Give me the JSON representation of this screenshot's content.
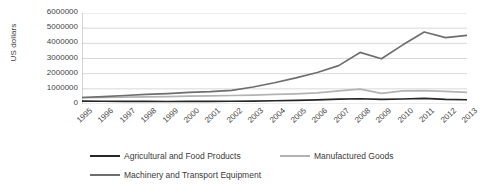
{
  "chart_data": {
    "type": "line",
    "title": "",
    "xlabel": "",
    "ylabel": "US dollars",
    "grid": true,
    "legend_position": "bottom",
    "ylim": [
      0,
      6000000
    ],
    "ytick_labels": [
      "6000000",
      "5000000",
      "4000000",
      "3000000",
      "2000000",
      "1000000",
      "0"
    ],
    "ytick_values": [
      6000000,
      5000000,
      4000000,
      3000000,
      2000000,
      1000000,
      0
    ],
    "categories": [
      "1995",
      "1996",
      "1997",
      "1998",
      "1999",
      "2000",
      "2001",
      "2002",
      "2003",
      "2004",
      "2005",
      "2006",
      "2007",
      "2008",
      "2009",
      "2010",
      "2011",
      "2012",
      "2013"
    ],
    "series": [
      {
        "name": "Agricultural and Food Products",
        "color": "#262626",
        "values": [
          190000,
          180000,
          175000,
          170000,
          165000,
          170000,
          175000,
          180000,
          195000,
          215000,
          240000,
          275000,
          320000,
          345000,
          300000,
          330000,
          370000,
          300000,
          280000
        ]
      },
      {
        "name": "Manufactured Goods",
        "color": "#b3b3b3",
        "values": [
          420000,
          430000,
          450000,
          470000,
          490000,
          520000,
          540000,
          560000,
          590000,
          630000,
          670000,
          740000,
          860000,
          980000,
          700000,
          860000,
          880000,
          830000,
          760000
        ]
      },
      {
        "name": "Machinery and Transport Equipment",
        "color": "#6e6e6e",
        "values": [
          430000,
          480000,
          560000,
          640000,
          690000,
          760000,
          810000,
          900000,
          1120000,
          1400000,
          1720000,
          2080000,
          2530000,
          3400000,
          2980000,
          3900000,
          4750000,
          4380000,
          4530000
        ]
      }
    ]
  },
  "legend": {
    "entries": [
      {
        "label": "Agricultural and Food Products",
        "color": "#262626"
      },
      {
        "label": "Manufactured Goods",
        "color": "#b3b3b3"
      },
      {
        "label": "Machinery and Transport Equipment",
        "color": "#6e6e6e"
      }
    ]
  },
  "axes": {
    "y_title": "US dollars"
  }
}
